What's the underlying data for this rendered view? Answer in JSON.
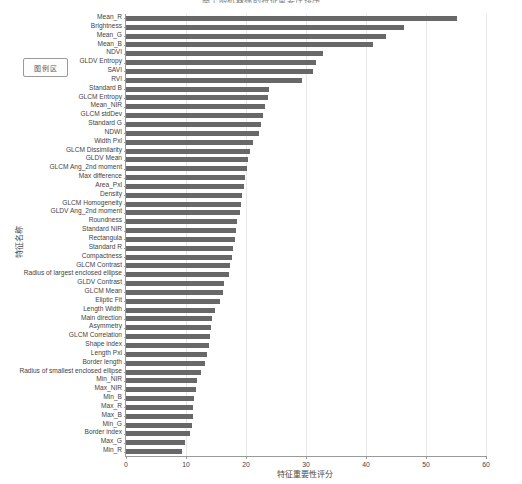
{
  "chart_data": {
    "type": "bar",
    "orientation": "horizontal",
    "title": "基于随机森林的特征重要性排序",
    "xlabel": "特征重要性评分",
    "ylabel": "特征名称",
    "xlim": [
      0,
      60
    ],
    "xticks": [
      0,
      10,
      20,
      30,
      40,
      50,
      60
    ],
    "grid": true,
    "legend": "图例区",
    "bar_color": "#686868",
    "categories": [
      "Mean_R",
      "Brightness",
      "Mean_G",
      "Mean_B",
      "NDVI",
      "GLDV Entropy",
      "SAVI",
      "RVI",
      "Standard B",
      "GLCM Entropy",
      "Mean_NIR",
      "GLCM stdDev",
      "Standard G",
      "NDWI",
      "Width Pxl",
      "GLCM Dissimilarity",
      "GLDV Mean",
      "GLCM Ang_2nd moment",
      "Max difference",
      "Area_Pxl",
      "Density",
      "GLCM Homogeneity",
      "GLDV Ang_2nd moment",
      "Roundness",
      "Standard NIR",
      "Rectangula",
      "Standard R",
      "Compactness",
      "GLCM Contrast",
      "Radius of largest enclosed ellipse",
      "GLDV Contrast",
      "GLCM Mean",
      "Eliptic Fit",
      "Length Width",
      "Main direction",
      "Asymmetry",
      "GLCM Correlation",
      "Shape index",
      "Length Pxl",
      "Border length",
      "Radius of smallest enclosed ellipse",
      "Min_NIR",
      "Max_NIR",
      "Min_B",
      "Max_R",
      "Max_B",
      "Min_G",
      "Border index",
      "Max_G",
      "Min_R"
    ],
    "values": [
      55.2,
      46.3,
      43.4,
      41.2,
      32.8,
      31.6,
      31.2,
      29.4,
      23.9,
      23.6,
      23.2,
      22.8,
      22.5,
      22.2,
      21.1,
      20.6,
      20.4,
      20.1,
      19.9,
      19.7,
      19.4,
      19.2,
      19.0,
      18.5,
      18.3,
      18.1,
      17.9,
      17.6,
      17.4,
      17.2,
      16.4,
      16.1,
      15.6,
      14.9,
      14.4,
      14.2,
      14.0,
      13.8,
      13.5,
      13.2,
      12.5,
      11.8,
      11.6,
      11.3,
      11.2,
      11.1,
      11.0,
      10.6,
      9.8,
      9.3
    ]
  }
}
